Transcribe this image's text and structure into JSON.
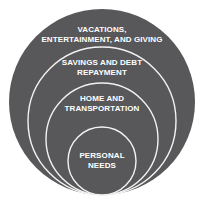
{
  "diagram": {
    "type": "nested-circles",
    "colors": {
      "fill": "#58585a",
      "ring_stroke": "#f2f2f2",
      "text": "#ffffff",
      "background": "#ffffff"
    },
    "circles": [
      {
        "level": 1,
        "lines": [
          "VACATIONS,",
          "ENTERTAINMENT, AND GIVING"
        ]
      },
      {
        "level": 2,
        "lines": [
          "SAVINGS AND DEBT",
          "REPAYMENT"
        ]
      },
      {
        "level": 3,
        "lines": [
          "HOME AND",
          "TRANSPORTATION"
        ]
      },
      {
        "level": 4,
        "lines": [
          "PERSONAL",
          "NEEDS"
        ]
      }
    ]
  }
}
